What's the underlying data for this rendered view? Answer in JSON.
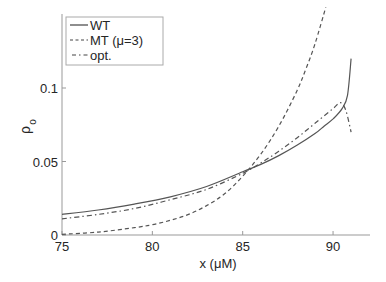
{
  "chart_data": {
    "type": "line",
    "title": "",
    "xlabel": "x (μM)",
    "ylabel_main": "ρ",
    "ylabel_sub": "o",
    "xlim": [
      75,
      92
    ],
    "ylim": [
      0,
      0.15
    ],
    "xticks": [
      75,
      80,
      85,
      90
    ],
    "xtick_labels": [
      "75",
      "80",
      "85",
      "90"
    ],
    "yticks": [
      0,
      0.05,
      0.1
    ],
    "ytick_labels": [
      "0",
      "0.05",
      "0.1"
    ],
    "grid": false,
    "legend_position": "top-left",
    "series": [
      {
        "name": "WT",
        "style": "solid",
        "color": "#555555",
        "x": [
          75,
          77,
          79,
          81,
          83,
          85,
          86,
          87,
          88,
          89,
          89.5,
          90,
          90.5,
          90.8,
          91
        ],
        "y": [
          0.014,
          0.017,
          0.021,
          0.026,
          0.033,
          0.043,
          0.048,
          0.054,
          0.061,
          0.069,
          0.074,
          0.079,
          0.086,
          0.095,
          0.12
        ]
      },
      {
        "name": "MT (μ=3)",
        "style": "dashed",
        "color": "#555555",
        "x": [
          75,
          77,
          79,
          80,
          81,
          82,
          83,
          84,
          85,
          86,
          87,
          88,
          88.5,
          89,
          89.6
        ],
        "y": [
          0.0005,
          0.002,
          0.005,
          0.007,
          0.01,
          0.014,
          0.02,
          0.028,
          0.04,
          0.055,
          0.074,
          0.098,
          0.113,
          0.13,
          0.155
        ]
      },
      {
        "name": "opt.",
        "style": "dashdot",
        "color": "#555555",
        "x": [
          75,
          77,
          79,
          81,
          83,
          85,
          86,
          87,
          88,
          89,
          90,
          90.4,
          90.7,
          91
        ],
        "y": [
          0.011,
          0.014,
          0.018,
          0.024,
          0.031,
          0.042,
          0.049,
          0.057,
          0.066,
          0.076,
          0.086,
          0.09,
          0.085,
          0.07
        ]
      }
    ]
  }
}
